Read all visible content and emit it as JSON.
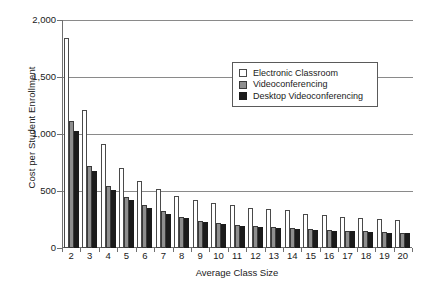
{
  "chart_data": {
    "type": "bar",
    "title": "",
    "xlabel": "Average Class Size",
    "ylabel": "Cost per Student Enrollment",
    "categories": [
      "2",
      "3",
      "4",
      "5",
      "6",
      "7",
      "8",
      "9",
      "10",
      "11",
      "12",
      "13",
      "14",
      "15",
      "16",
      "17",
      "18",
      "19",
      "20"
    ],
    "ylim": [
      0,
      2000
    ],
    "yticks": [
      "0",
      "500",
      "1,000",
      "1,500",
      "2,000"
    ],
    "ytick_values": [
      0,
      500,
      1000,
      1500,
      2000
    ],
    "grid": "horizontal",
    "legend_position": "upper-right-inside",
    "series": [
      {
        "name": "Electronic Classroom",
        "color": "#ffffff",
        "values": [
          1840,
          1210,
          910,
          700,
          590,
          515,
          460,
          425,
          395,
          375,
          355,
          345,
          330,
          300,
          290,
          275,
          265,
          255,
          245
        ]
      },
      {
        "name": "Videoconferencing",
        "color": "#8e8e8e",
        "values": [
          1110,
          720,
          540,
          450,
          380,
          325,
          275,
          240,
          220,
          205,
          195,
          185,
          175,
          165,
          155,
          150,
          145,
          140,
          135
        ]
      },
      {
        "name": "Desktop  Videoconferencing",
        "color": "#1b1b1b",
        "values": [
          1030,
          675,
          510,
          425,
          355,
          300,
          260,
          230,
          210,
          195,
          185,
          175,
          168,
          158,
          150,
          145,
          140,
          135,
          130
        ]
      }
    ]
  }
}
